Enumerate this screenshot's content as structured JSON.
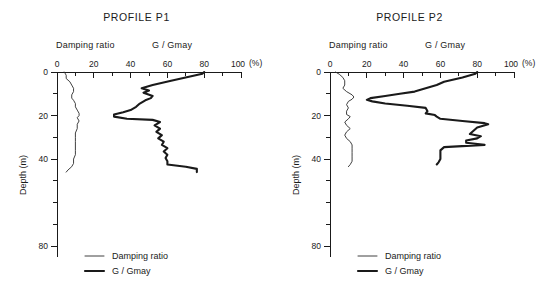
{
  "figure": {
    "x_axis_unit": "(%)",
    "y_axis_title": "Depth (m)"
  },
  "panels": [
    {
      "id": "p1",
      "title": "PROFILE P1",
      "head_damping": "Damping ratio",
      "head_ggmax": "G / Gmay",
      "legend": [
        {
          "label": "Damping ratio",
          "style": "thin"
        },
        {
          "label": "G / Gmay",
          "style": "thick"
        }
      ]
    },
    {
      "id": "p2",
      "title": "PROFILE P2",
      "head_damping": "Damping ratio",
      "head_ggmax": "G / Gmay",
      "legend": [
        {
          "label": "Damping ratio",
          "style": "thin"
        },
        {
          "label": "G / Gmay",
          "style": "thick"
        }
      ]
    }
  ],
  "axes": {
    "x_ticks_major": [
      0,
      20,
      40,
      60,
      80,
      100
    ],
    "x_ticks_minor": [
      10,
      30,
      50,
      70,
      90
    ],
    "x_tick_labels": [
      "0",
      "20",
      "40",
      "60",
      "80",
      "100"
    ],
    "y_ticks_major": [
      0,
      20,
      40,
      80
    ],
    "y_tick_labels": [
      "0",
      "20",
      "40",
      "80"
    ],
    "y_ticks_minor": [
      10,
      30,
      50,
      60,
      70
    ],
    "xlim": [
      0,
      100
    ],
    "ylim": [
      0,
      85
    ]
  },
  "chart_data": [
    {
      "type": "line",
      "title": "PROFILE P1",
      "xlabel": "(%)",
      "ylabel": "Depth (m)",
      "xlim": [
        0,
        100
      ],
      "ylim": [
        0,
        85
      ],
      "y_inverted": true,
      "grid": false,
      "legend_position": "bottom-left",
      "series": [
        {
          "name": "Damping ratio",
          "style": "thin",
          "points": [
            [
              4,
              0
            ],
            [
              5,
              1.5
            ],
            [
              5,
              3
            ],
            [
              7,
              4.5
            ],
            [
              8,
              6
            ],
            [
              9,
              7.5
            ],
            [
              9,
              9
            ],
            [
              8,
              10.5
            ],
            [
              8,
              12
            ],
            [
              9,
              13
            ],
            [
              10,
              14.5
            ],
            [
              10,
              16
            ],
            [
              11,
              17.5
            ],
            [
              12,
              19
            ],
            [
              12,
              20
            ],
            [
              11,
              21
            ],
            [
              12,
              22.5
            ],
            [
              11,
              24
            ],
            [
              11,
              26
            ],
            [
              10,
              28
            ],
            [
              10,
              30
            ],
            [
              10,
              32
            ],
            [
              10,
              34
            ],
            [
              10,
              36
            ],
            [
              10,
              38
            ],
            [
              9,
              40
            ],
            [
              9,
              42
            ],
            [
              8,
              43.5
            ],
            [
              6,
              45
            ],
            [
              5,
              46
            ]
          ]
        },
        {
          "name": "G / Gmay",
          "style": "thick",
          "points": [
            [
              80,
              0
            ],
            [
              79,
              0.8
            ],
            [
              62,
              4
            ],
            [
              52,
              6
            ],
            [
              46,
              7.5
            ],
            [
              50,
              8.5
            ],
            [
              47,
              9.5
            ],
            [
              52,
              11
            ],
            [
              51,
              12
            ],
            [
              48,
              13
            ],
            [
              45,
              14.5
            ],
            [
              43,
              16
            ],
            [
              40,
              17.5
            ],
            [
              36,
              18.5
            ],
            [
              31,
              19.5
            ],
            [
              31,
              20.5
            ],
            [
              38,
              21.5
            ],
            [
              52,
              22
            ],
            [
              56,
              23
            ],
            [
              53,
              24.5
            ],
            [
              56,
              26
            ],
            [
              54,
              27.5
            ],
            [
              57,
              29
            ],
            [
              55,
              30.5
            ],
            [
              58,
              32
            ],
            [
              57,
              33.5
            ],
            [
              60,
              35
            ],
            [
              58,
              36.5
            ],
            [
              60,
              38
            ],
            [
              59,
              39.5
            ],
            [
              60,
              41
            ],
            [
              60,
              42.5
            ],
            [
              70,
              43.5
            ],
            [
              76,
              44.5
            ],
            [
              76,
              46
            ]
          ]
        }
      ]
    },
    {
      "type": "line",
      "title": "PROFILE P2",
      "xlabel": "(%)",
      "ylabel": "Depth (m)",
      "xlim": [
        0,
        100
      ],
      "ylim": [
        0,
        85
      ],
      "y_inverted": true,
      "grid": false,
      "legend_position": "bottom-left",
      "series": [
        {
          "name": "Damping ratio",
          "style": "thin",
          "points": [
            [
              3,
              0
            ],
            [
              5,
              1
            ],
            [
              7,
              2.5
            ],
            [
              8,
              4
            ],
            [
              8,
              6
            ],
            [
              7,
              7.5
            ],
            [
              9,
              9
            ],
            [
              12,
              10.5
            ],
            [
              13,
              11.5
            ],
            [
              12,
              12.5
            ],
            [
              10,
              13.5
            ],
            [
              9,
              15
            ],
            [
              10,
              16.5
            ],
            [
              9,
              18
            ],
            [
              9,
              19.5
            ],
            [
              11,
              20.5
            ],
            [
              10,
              21.5
            ],
            [
              8,
              23
            ],
            [
              9,
              24.5
            ],
            [
              11,
              26
            ],
            [
              9,
              27.5
            ],
            [
              8,
              29
            ],
            [
              9,
              30.5
            ],
            [
              11,
              32
            ],
            [
              12,
              33.5
            ],
            [
              12,
              35
            ],
            [
              12,
              37
            ],
            [
              12,
              39
            ],
            [
              12,
              41
            ],
            [
              11,
              42.5
            ],
            [
              10,
              43.5
            ]
          ]
        },
        {
          "name": "G / Gmay",
          "style": "thick",
          "points": [
            [
              80,
              0
            ],
            [
              79,
              0.8
            ],
            [
              72,
              2.5
            ],
            [
              62,
              4.5
            ],
            [
              58,
              6
            ],
            [
              52,
              7.5
            ],
            [
              46,
              9
            ],
            [
              38,
              10
            ],
            [
              30,
              11
            ],
            [
              22,
              12
            ],
            [
              20,
              12.8
            ],
            [
              23,
              13.5
            ],
            [
              30,
              14.5
            ],
            [
              42,
              15.5
            ],
            [
              52,
              16.5
            ],
            [
              53,
              18
            ],
            [
              52,
              19
            ],
            [
              57,
              19.8
            ],
            [
              58,
              20.5
            ],
            [
              60,
              21.5
            ],
            [
              72,
              22.5
            ],
            [
              84,
              23.5
            ],
            [
              86,
              24
            ],
            [
              80,
              25.5
            ],
            [
              78,
              27
            ],
            [
              76,
              28.5
            ],
            [
              82,
              29.5
            ],
            [
              80,
              30.5
            ],
            [
              74,
              31.5
            ],
            [
              74,
              32.5
            ],
            [
              84,
              33.5
            ],
            [
              62,
              34.5
            ],
            [
              60,
              36
            ],
            [
              60,
              38
            ],
            [
              60,
              40
            ],
            [
              59,
              41.5
            ],
            [
              58,
              42.5
            ]
          ]
        }
      ]
    }
  ]
}
